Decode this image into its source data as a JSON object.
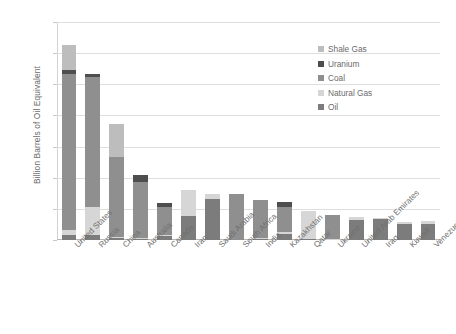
{
  "chart_data": {
    "type": "bar",
    "stacked": true,
    "title": "",
    "xlabel": "",
    "ylabel": "Billion Barrels of Oil Equivalent",
    "ylim": [
      0,
      1400
    ],
    "ytick_values": [
      0,
      200,
      400,
      600,
      800,
      1000,
      1200,
      1400
    ],
    "ytick_labels": [
      "0",
      "200",
      "400",
      "600",
      "800",
      "1000",
      "1200",
      "1400"
    ],
    "grid": "horizontal",
    "legend_position": "upper-right-inside",
    "categories": [
      "United States",
      "Russia",
      "China",
      "Australia",
      "Canada",
      "Iran",
      "Saudi Arabia",
      "South Africa",
      "India",
      "Kazakhstan",
      "Qatar",
      "Ukraine",
      "United Arab Emirates",
      "Iraq",
      "Kuwait",
      "Venezuela"
    ],
    "series": [
      {
        "name": "Oil",
        "color": "#7c7c7c",
        "values": [
          35,
          35,
          10,
          5,
          30,
          155,
          265,
          0,
          10,
          40,
          5,
          0,
          130,
          135,
          105,
          100
        ]
      },
      {
        "name": "Natural Gas",
        "color": "#d6d6d6",
        "values": [
          30,
          175,
          10,
          5,
          5,
          165,
          30,
          0,
          5,
          10,
          180,
          5,
          15,
          5,
          10,
          20
        ]
      },
      {
        "name": "Coal",
        "color": "#8f8f8f",
        "values": [
          1000,
          835,
          510,
          360,
          175,
          0,
          0,
          295,
          245,
          165,
          0,
          155,
          0,
          0,
          0,
          0
        ]
      },
      {
        "name": "Uranium",
        "color": "#4e4e4e",
        "values": [
          30,
          20,
          0,
          45,
          30,
          0,
          0,
          0,
          0,
          30,
          0,
          0,
          0,
          0,
          0,
          0
        ]
      },
      {
        "name": "Shale Gas",
        "color": "#bdbdbd",
        "values": [
          160,
          0,
          215,
          0,
          0,
          0,
          0,
          0,
          0,
          0,
          0,
          0,
          0,
          0,
          0,
          0
        ]
      }
    ],
    "totals": [
      1255,
      1065,
      745,
      415,
      240,
      320,
      295,
      295,
      260,
      245,
      185,
      160,
      145,
      140,
      115,
      120
    ],
    "legend_entries": [
      {
        "label": "Shale Gas",
        "color": "#bdbdbd"
      },
      {
        "label": "Uranium",
        "color": "#4e4e4e"
      },
      {
        "label": "Coal",
        "color": "#8f8f8f"
      },
      {
        "label": "Natural Gas",
        "color": "#d6d6d6"
      },
      {
        "label": "Oil",
        "color": "#7c7c7c"
      }
    ]
  }
}
